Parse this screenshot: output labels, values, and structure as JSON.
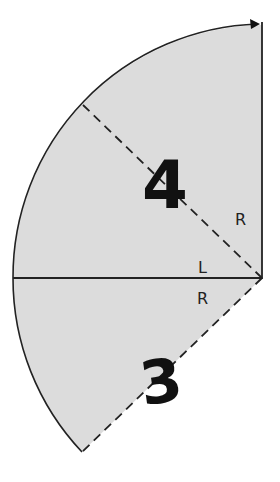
{
  "diagram": {
    "colors": {
      "fill": "#dcdcdc",
      "stroke": "#222222",
      "background": "#ffffff",
      "label": "#111111"
    },
    "regions": [
      {
        "id": "region-4",
        "label": "4"
      },
      {
        "id": "region-3",
        "label": "3"
      }
    ],
    "segment_labels": {
      "upper_dashed_radius": "R",
      "horizontal_radius_top": "L",
      "horizontal_radius_bottom": "R"
    },
    "geometry": {
      "center": [
        262,
        278
      ],
      "radius": 253,
      "arc_start_deg": 90,
      "arc_end_deg": 225,
      "dashed_radius_deg": 135,
      "solid_radii_deg": [
        90,
        180
      ],
      "arrow_direction": "clockwise-at-top"
    }
  }
}
